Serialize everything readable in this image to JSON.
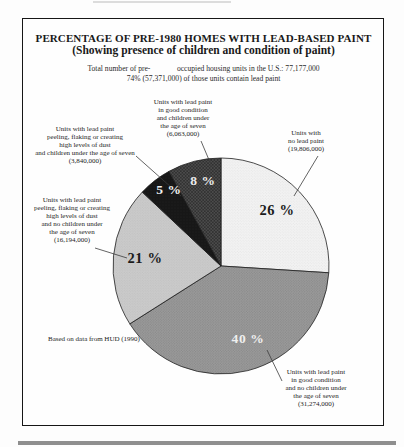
{
  "figure": {
    "title_line1": "PERCENTAGE OF PRE-1980 HOMES WITH LEAD-BASED PAINT",
    "title_line2": "(Showing presence of children and condition of paint)",
    "subtitle_line1": "Total number of pre-              occupied housing units in the U.S.: 77,177,000",
    "subtitle_line2": "74% (57,371,000) of those units contain lead paint",
    "source_note": "Based on data from HUD (1990)"
  },
  "chart_data": {
    "type": "pie",
    "title": "PERCENTAGE OF PRE-1980 HOMES WITH LEAD-BASED PAINT",
    "subtitle": "(Showing presence of children and condition of paint)",
    "start_angle_deg": 0,
    "direction": "clockwise",
    "slices": [
      {
        "key": "no-lead-paint",
        "label": "Units with no lead paint",
        "units_text": "(19,806,000)",
        "percent": 26,
        "pct_text": "26 %",
        "color": "#f1f1f1",
        "pct_color": "#1b1b1b"
      },
      {
        "key": "good-condition-no-children",
        "label": "Units with lead paint in good condition and no children under the age of seven",
        "units_text": "(31,274,000)",
        "percent": 40,
        "pct_text": "40 %",
        "color": "#969696",
        "pct_color": "#efefef"
      },
      {
        "key": "peeling-no-children",
        "label": "Units with lead paint peeling, flaking or creating high levels of dust and no children under the age of seven",
        "units_text": "(16,194,000)",
        "percent": 21,
        "pct_text": "21 %",
        "color": "#c8c8c8",
        "pct_color": "#1b1b1b"
      },
      {
        "key": "peeling-children",
        "label": "Units with lead paint peeling, flaking or creating high levels of dust and children under the age of seven",
        "units_text": "(3,840,000)",
        "percent": 5,
        "pct_text": "5 %",
        "color": "#161616",
        "pct_color": "#f1f1f1"
      },
      {
        "key": "good-condition-children",
        "label": "Units with lead paint in good condition and children under the age of seven",
        "units_text": "(6,063,000)",
        "percent": 8,
        "pct_text": "8 %",
        "color": "#4a4a4a",
        "pct_color": "#ebebeb"
      }
    ]
  },
  "callouts": {
    "good_condition_children": {
      "lines": [
        "Units with lead paint",
        "in good condition",
        "and children under",
        "the age of seven",
        "(6,063,000)"
      ]
    },
    "peeling_children": {
      "lines": [
        "Units with lead paint",
        "peeling, flaking or creating",
        "high levels of dust",
        "and children under the age of seven",
        "(3,840,000)"
      ]
    },
    "peeling_no_children": {
      "lines": [
        "Units with lead paint",
        "peeling, flaking or creating",
        "high levels of dust",
        "and no children under",
        "the age of seven",
        "(16,194,000)"
      ]
    },
    "no_lead_paint": {
      "lines": [
        "Units with",
        "no lead paint",
        "(19,806,000)"
      ]
    },
    "good_condition_no_children": {
      "lines": [
        "Units with lead paint",
        "in good condition",
        "and no children under",
        "the age of seven",
        "(31,274,000)"
      ]
    }
  }
}
